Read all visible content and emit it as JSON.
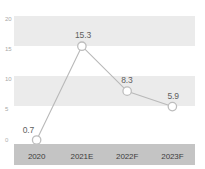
{
  "chart_data": {
    "type": "line",
    "title": "",
    "subtitle": "",
    "xlabel": "",
    "ylabel": "",
    "categories": [
      "2020",
      "2021E",
      "2022F",
      "2023F"
    ],
    "values": [
      0.7,
      15.3,
      8.3,
      5.9
    ],
    "series": [
      {
        "name": "",
        "values": [
          0.7,
          15.3,
          8.3,
          5.9
        ]
      }
    ],
    "point_labels": [
      "0.7",
      "15.3",
      "8.3",
      "5.9"
    ],
    "ylim": [
      0,
      20
    ],
    "yticks": [
      0,
      5,
      10,
      15,
      20
    ],
    "ytick_labels": [
      "0",
      "5",
      "10",
      "15",
      "20"
    ],
    "grid": false,
    "banded_background": true,
    "band_ranges": [
      [
        15,
        20
      ],
      [
        5,
        10
      ]
    ],
    "legend": null,
    "legend_position": "none",
    "colors": {
      "line": "#b9b9b9",
      "marker_fill": "#ffffff",
      "marker_stroke": "#bdbdbd",
      "band": "#ebebeb",
      "axis_strip": "#c4c4c4",
      "value_label": "#5e5e5e",
      "tick_label": "#a8a8a8",
      "xtick_label": "#3d3d3d",
      "background": "#ffffff"
    }
  }
}
